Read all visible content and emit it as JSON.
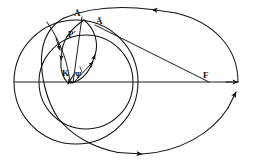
{
  "figure": {
    "type": "geometric-diagram",
    "background_color": "#ffffff",
    "stroke_color": "#111111",
    "canvas": {
      "width": 254,
      "height": 166
    }
  },
  "labels": {
    "apex_point": "Å",
    "apex_bar_point": "Ā",
    "p_prime_point": "P′",
    "k_point": "K",
    "psi_angle": "Ψ",
    "focus_point": "F"
  },
  "elements": {
    "outer_ellipse": "large orbital ellipse with directional arrowheads",
    "large_circle": "leftmost large circle",
    "medium_circle": "inner medium circle centered on the axis",
    "inner_loop": "small narrow epicyclic loop with arrows",
    "axis_line": "horizontal major axis line",
    "focal_ray": "straight line from focus F to point Ā",
    "radius_segment": "segment from K through the loop"
  },
  "arrowheads": [
    {
      "name": "ellipse-top-arrow",
      "direction": "left"
    },
    {
      "name": "ellipse-right-arrow",
      "direction": "up"
    },
    {
      "name": "ellipse-bottom-arrow",
      "direction": "right"
    },
    {
      "name": "axis-right-arrow",
      "direction": "right"
    },
    {
      "name": "loop-left-arrow",
      "direction": "down"
    },
    {
      "name": "loop-right-arrow",
      "direction": "up"
    },
    {
      "name": "loop-bottom-arrow",
      "direction": "down-left"
    },
    {
      "name": "psi-ray-arrow",
      "direction": "up-right"
    }
  ]
}
